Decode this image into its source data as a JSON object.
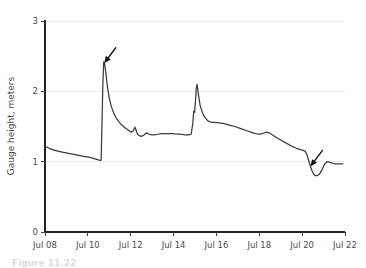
{
  "chart_data": {
    "type": "line",
    "title": "",
    "subtitle": "",
    "xlabel": "",
    "ylabel": "Gauge height, meters",
    "xlim": [
      0,
      14
    ],
    "ylim": [
      0,
      3
    ],
    "grid": true,
    "grid_axis": "y",
    "legend": false,
    "legend_position": "none",
    "line_color": "#3b3b3b",
    "background_color": "#ffffff",
    "x_tick_labels": [
      "Jul 08",
      "Jul 10",
      "Jul 12",
      "Jul 14",
      "Jul 16",
      "Jul 18",
      "Jul 20",
      "Jul 22"
    ],
    "x_tick_values": [
      0,
      2,
      4,
      6,
      8,
      10,
      12,
      14
    ],
    "y_tick_labels": [
      "0",
      "1",
      "2",
      "3"
    ],
    "y_tick_values": [
      0,
      1,
      2,
      3
    ],
    "series": [
      {
        "name": "Gauge height",
        "x": [
          0.0,
          0.2,
          0.45,
          0.75,
          1.05,
          1.4,
          1.75,
          2.1,
          2.45,
          2.55,
          2.62,
          2.66,
          2.7,
          2.74,
          2.78,
          2.84,
          2.92,
          3.0,
          3.1,
          3.22,
          3.36,
          3.52,
          3.7,
          3.88,
          4.02,
          4.12,
          4.2,
          4.26,
          4.32,
          4.4,
          4.5,
          4.62,
          4.74,
          4.86,
          4.98,
          5.1,
          5.26,
          5.44,
          5.62,
          5.8,
          5.98,
          6.16,
          6.34,
          6.52,
          6.7,
          6.82,
          6.9,
          6.94,
          6.98,
          7.02,
          7.06,
          7.1,
          7.16,
          7.24,
          7.34,
          7.46,
          7.6,
          7.76,
          7.94,
          8.14,
          8.36,
          8.6,
          8.86,
          9.14,
          9.42,
          9.7,
          9.96,
          10.16,
          10.32,
          10.46,
          10.62,
          10.82,
          11.04,
          11.28,
          11.52,
          11.74,
          11.92,
          12.04,
          12.14,
          12.22,
          12.3,
          12.38,
          12.46,
          12.54,
          12.62,
          12.7,
          12.8,
          12.92,
          13.04,
          13.16,
          13.3,
          13.5,
          13.7,
          13.9
        ],
        "y": [
          1.22,
          1.19,
          1.16,
          1.14,
          1.12,
          1.1,
          1.08,
          1.06,
          1.03,
          1.02,
          1.02,
          1.55,
          2.1,
          2.42,
          2.4,
          2.26,
          2.05,
          1.9,
          1.78,
          1.68,
          1.6,
          1.54,
          1.49,
          1.45,
          1.42,
          1.44,
          1.49,
          1.44,
          1.39,
          1.37,
          1.36,
          1.38,
          1.41,
          1.39,
          1.38,
          1.38,
          1.39,
          1.4,
          1.4,
          1.4,
          1.4,
          1.39,
          1.39,
          1.38,
          1.38,
          1.39,
          1.55,
          1.72,
          1.7,
          1.85,
          2.05,
          2.1,
          1.95,
          1.8,
          1.7,
          1.63,
          1.58,
          1.56,
          1.56,
          1.55,
          1.54,
          1.52,
          1.5,
          1.47,
          1.44,
          1.41,
          1.39,
          1.4,
          1.42,
          1.41,
          1.38,
          1.34,
          1.3,
          1.26,
          1.22,
          1.19,
          1.17,
          1.16,
          1.15,
          1.1,
          1.02,
          0.94,
          0.87,
          0.82,
          0.8,
          0.8,
          0.82,
          0.88,
          0.96,
          1.0,
          0.99,
          0.97,
          0.97,
          0.97
        ]
      }
    ],
    "annotations": [
      {
        "name": "arrow-first-peak",
        "kind": "arrow",
        "target_x": 2.76,
        "target_y": 2.4,
        "tail_x": 3.3,
        "tail_y": 2.62,
        "color": "#111111"
      },
      {
        "name": "arrow-late-dip",
        "kind": "arrow",
        "target_x": 12.38,
        "target_y": 0.93,
        "tail_x": 12.95,
        "tail_y": 1.16,
        "color": "#111111"
      }
    ]
  },
  "caption": {
    "text": "Figure 11.22"
  }
}
